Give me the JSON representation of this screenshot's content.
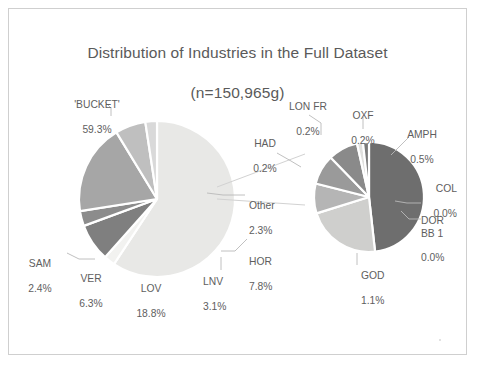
{
  "chart_data": {
    "type": "pie",
    "title": "Distribution of Industries in the Full Dataset\n(n=150,965g)",
    "title_line1": "Distribution of Industries in the Full Dataset",
    "title_line2": "(n=150,965g)",
    "subtitle": "",
    "xlabel": "",
    "ylabel": "",
    "variant": "pie-of-pie",
    "legend": "none",
    "grid": false,
    "categories": [
      "'BUCKET'",
      "LOV",
      "HOR",
      "VER",
      "LNV",
      "SAM",
      "Other"
    ],
    "values": [
      59.3,
      18.8,
      7.8,
      6.3,
      3.1,
      2.4,
      2.3
    ],
    "value_unit": "%",
    "main_pie": {
      "slices": [
        {
          "label": "'BUCKET'",
          "value": 59.3,
          "value_text": "59.3%",
          "color": "#e8e8e6"
        },
        {
          "label": "Other",
          "value": 2.3,
          "value_text": "2.3%",
          "color": "#f2f2f0"
        },
        {
          "label": "HOR",
          "value": 7.8,
          "value_text": "7.8%",
          "color": "#7f7f7f"
        },
        {
          "label": "LNV",
          "value": 3.1,
          "value_text": "3.1%",
          "color": "#8c8c8c"
        },
        {
          "label": "LOV",
          "value": 18.8,
          "value_text": "18.8%",
          "color": "#a6a6a6"
        },
        {
          "label": "VER",
          "value": 6.3,
          "value_text": "6.3%",
          "color": "#bfbfbf"
        },
        {
          "label": "SAM",
          "value": 2.4,
          "value_text": "2.4%",
          "color": "#d9d9d9"
        }
      ]
    },
    "detail_pie": {
      "source_label": "Other",
      "source_value": 2.3,
      "slices": [
        {
          "label": "GOD",
          "value": 1.1,
          "value_text": "1.1%",
          "color": "#6e6e6e"
        },
        {
          "label": "AMPH",
          "value": 0.5,
          "value_text": "0.5%",
          "color": "#cfcfcd"
        },
        {
          "label": "OXF",
          "value": 0.2,
          "value_text": "0.2%",
          "color": "#b5b5b5"
        },
        {
          "label": "LON FR",
          "value": 0.2,
          "value_text": "0.2%",
          "color": "#9a9a9a"
        },
        {
          "label": "HAD",
          "value": 0.2,
          "value_text": "0.2%",
          "color": "#8a8a8a"
        },
        {
          "label": "COL",
          "value": 0.0,
          "value_text": "0.0%",
          "color": "#e0e0de"
        },
        {
          "label": "DOR BB 1",
          "value": 0.0,
          "value_text": "0.0%",
          "color": "#7a7a7a"
        }
      ]
    },
    "labels": {
      "bucket": {
        "name": "'BUCKET'",
        "pct": "59.3%"
      },
      "sam": {
        "name": "SAM",
        "pct": "2.4%"
      },
      "ver": {
        "name": "VER",
        "pct": "6.3%"
      },
      "lov": {
        "name": "LOV",
        "pct": "18.8%"
      },
      "lnv": {
        "name": "LNV",
        "pct": "3.1%"
      },
      "hor": {
        "name": "HOR",
        "pct": "7.8%"
      },
      "other": {
        "name": "Other",
        "pct": "2.3%"
      },
      "lonfr": {
        "name": "LON FR",
        "pct": "0.2%"
      },
      "oxf": {
        "name": "OXF",
        "pct": "0.2%"
      },
      "had": {
        "name": "HAD",
        "pct": "0.2%"
      },
      "amph": {
        "name": "AMPH",
        "pct": "0.5%"
      },
      "col": {
        "name": "COL",
        "pct": "0.0%"
      },
      "dor": {
        "name": "DOR\nBB 1",
        "pct": "0.0%"
      },
      "god": {
        "name": "GOD",
        "pct": "1.1%"
      }
    },
    "colors": {
      "text": "#5e5e5e",
      "border": "#cfcfcf",
      "background": "#ffffff",
      "leader_line": "#bdbdbd"
    }
  }
}
